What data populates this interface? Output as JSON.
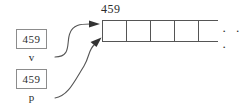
{
  "diagram": {
    "title_label": "459",
    "variables": [
      {
        "name": "v",
        "value": "459"
      },
      {
        "name": "p",
        "value": "459"
      }
    ],
    "array": {
      "header_value": "459",
      "visible_cells": 5,
      "cells": [
        "",
        "",
        "",
        "",
        ""
      ],
      "continuation": "· · ·"
    },
    "arrows": [
      {
        "from": "v",
        "to": "array-cell-0"
      },
      {
        "from": "p",
        "to": "array-cell-0"
      }
    ],
    "colors": {
      "stroke": "#8c8c8c",
      "array_stroke": "#555555",
      "text": "#2b2b2b",
      "background": "#ffffff"
    }
  }
}
